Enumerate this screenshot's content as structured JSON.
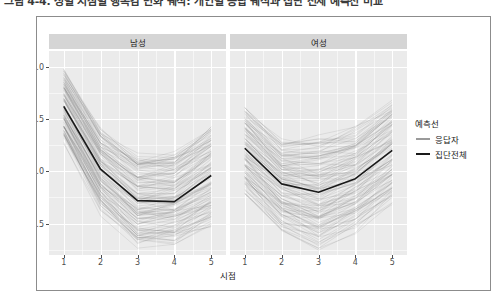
{
  "caption": "그림 4-4. 성별 시점별 행복감 변화 궤적: 개인별 응답 궤적과 집단 전체 예측선 비교",
  "axes": {
    "y_title": "행복감",
    "x_title": "시점",
    "y_ticks": [
      "4.0",
      "3.5",
      "3.0",
      "2.5"
    ],
    "x_ticks": [
      "1",
      "2",
      "3",
      "4",
      "5"
    ]
  },
  "facets": [
    {
      "key": "male",
      "label": "남성"
    },
    {
      "key": "female",
      "label": "여성"
    }
  ],
  "legend": {
    "title": "예측선",
    "items": [
      {
        "label": "응답자",
        "color": "#9a9a9a"
      },
      {
        "label": "집단전체",
        "color": "#1a1a1a"
      }
    ]
  },
  "colors": {
    "panel": "#ebebeb",
    "grid": "#ffffff",
    "strip": "#d5d5d5",
    "mean_line": "#1a1a1a",
    "individual_line": "#6f6f6f",
    "frame": "#8c8c8c",
    "tick_text": "#4d4d4d"
  },
  "chart_data": {
    "type": "line",
    "title": "",
    "xlabel": "시점",
    "ylabel": "행복감",
    "x": [
      1,
      2,
      3,
      4,
      5
    ],
    "xlim": [
      0.6,
      5.4
    ],
    "ylim": [
      2.2,
      4.15
    ],
    "y_ticks": [
      4.0,
      3.5,
      3.0,
      2.5
    ],
    "grid": true,
    "legend_position": "right",
    "facet_variable": "성별",
    "panels": [
      {
        "facet": "남성",
        "series": [
          {
            "name": "집단전체",
            "role": "group-mean",
            "color": "#1a1a1a",
            "values": [
              3.62,
              3.02,
              2.72,
              2.71,
              2.96
            ]
          },
          {
            "name": "응답자",
            "role": "individual-trajectories",
            "color": "#6f6f6f",
            "n": 120,
            "note": "개인별 궤적 (반투명 스파게티 선)",
            "value_range_by_timepoint": [
              [
                3.28,
                3.98
              ],
              [
                2.6,
                3.42
              ],
              [
                2.28,
                3.18
              ],
              [
                2.3,
                3.2
              ],
              [
                2.46,
                3.46
              ]
            ]
          }
        ]
      },
      {
        "facet": "여성",
        "series": [
          {
            "name": "집단전체",
            "role": "group-mean",
            "color": "#1a1a1a",
            "values": [
              3.22,
              2.88,
              2.8,
              2.93,
              3.2
            ]
          },
          {
            "name": "응답자",
            "role": "individual-trajectories",
            "color": "#6f6f6f",
            "n": 120,
            "note": "개인별 궤적 (반투명 스파게티 선)",
            "value_range_by_timepoint": [
              [
                2.78,
                3.62
              ],
              [
                2.44,
                3.3
              ],
              [
                2.26,
                3.34
              ],
              [
                2.42,
                3.44
              ],
              [
                2.7,
                3.7
              ]
            ]
          }
        ]
      }
    ]
  }
}
